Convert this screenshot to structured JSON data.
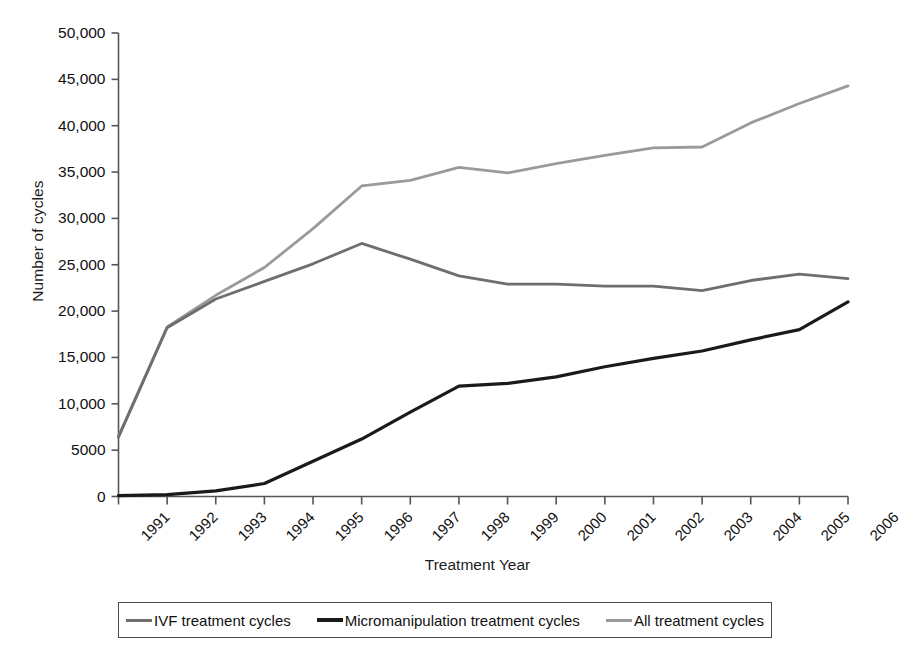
{
  "chart_data": {
    "type": "line",
    "title": "",
    "xlabel": "Treatment Year",
    "ylabel": "Number of cycles",
    "categories": [
      "1991",
      "1992",
      "1993",
      "1994",
      "1995",
      "1996",
      "1997",
      "1998",
      "1999",
      "2000",
      "2001",
      "2002",
      "2003",
      "2004",
      "2005",
      "2006"
    ],
    "x": [
      1991,
      1992,
      1993,
      1994,
      1995,
      1996,
      1997,
      1998,
      1999,
      2000,
      2001,
      2002,
      2003,
      2004,
      2005,
      2006
    ],
    "ylim": [
      0,
      50000
    ],
    "xlim": [
      1991,
      2006
    ],
    "yticks": [
      0,
      5000,
      10000,
      15000,
      20000,
      25000,
      30000,
      35000,
      40000,
      45000,
      50000
    ],
    "ytick_labels": [
      "0",
      "5000",
      "10,000",
      "15,000",
      "20,000",
      "25,000",
      "30,000",
      "35,000",
      "40,000",
      "45,000",
      "50,000"
    ],
    "grid": false,
    "legend_position": "bottom",
    "series": [
      {
        "name": "IVF treatment cycles",
        "color": "#6e6e6e",
        "values": [
          6400,
          18200,
          21300,
          23200,
          25100,
          27300,
          25600,
          23800,
          22900,
          22900,
          22700,
          22700,
          22200,
          23300,
          24000,
          23500
        ]
      },
      {
        "name": "Micromanipulation treatment cycles",
        "color": "#1a1a1a",
        "values": [
          100,
          200,
          600,
          1400,
          3800,
          6200,
          9100,
          11900,
          12200,
          12900,
          14000,
          14900,
          15700,
          16900,
          18000,
          21000
        ]
      },
      {
        "name": "All treatment cycles",
        "color": "#9a9a9a",
        "values": [
          6500,
          18300,
          21700,
          24700,
          28900,
          33500,
          34100,
          35500,
          34900,
          35900,
          36800,
          37600,
          37700,
          40300,
          42400,
          44300
        ]
      }
    ]
  },
  "axis": {
    "y_title": "Number of cycles",
    "x_title": "Treatment Year"
  },
  "legend": {
    "items": [
      {
        "label": "IVF treatment cycles",
        "color": "#6e6e6e"
      },
      {
        "label": "Micromanipulation treatment cycles",
        "color": "#1a1a1a"
      },
      {
        "label": "All treatment cycles",
        "color": "#9a9a9a"
      }
    ]
  }
}
